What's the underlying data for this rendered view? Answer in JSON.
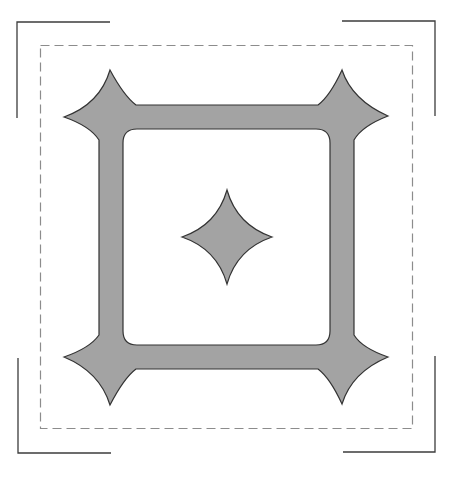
{
  "figure": {
    "colors": {
      "background": "#ffffff",
      "shape_fill": "#a3a3a3",
      "shape_stroke": "#333333",
      "dashed_border": "#8c8c8c",
      "corner_bracket": "#3c3c3c"
    },
    "elements": [
      {
        "name": "crop-marks",
        "type": "corner-brackets",
        "count": 4
      },
      {
        "name": "seam-allowance",
        "type": "dashed-rectangle"
      },
      {
        "name": "frame",
        "type": "square-frame-with-star-corners",
        "count_stars": 4
      },
      {
        "name": "center-diamond",
        "type": "concave-diamond"
      }
    ]
  }
}
